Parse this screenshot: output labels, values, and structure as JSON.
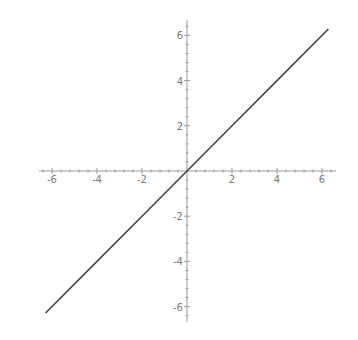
{
  "chart_data": {
    "type": "line",
    "title": "",
    "xlabel": "",
    "ylabel": "",
    "function": "y = x",
    "xlim": [
      -6.5,
      6.5
    ],
    "ylim": [
      -6.5,
      6.5
    ],
    "grid": false,
    "legend": null,
    "axes_origin": [
      0,
      0
    ],
    "x_ticks": [
      -6,
      -4,
      -2,
      2,
      4,
      6
    ],
    "y_ticks": [
      -6,
      -4,
      -2,
      2,
      4,
      6
    ],
    "x_tick_labels": [
      "-6",
      "-4",
      "-2",
      "2",
      "4",
      "6"
    ],
    "y_tick_labels": [
      "-6",
      "-4",
      "-2",
      "2",
      "4",
      "6"
    ],
    "minor_tick_step": 0.4,
    "series": [
      {
        "name": "y = x",
        "color": "#454545",
        "x": [
          -6.283,
          -4,
          -2,
          0,
          2,
          4,
          6.283
        ],
        "y": [
          -6.283,
          -4,
          -2,
          0,
          2,
          4,
          6.283
        ]
      }
    ]
  },
  "style": {
    "axis_color": "#9a9a9a",
    "label_color": "#7a7a7a",
    "line_color": "#454545",
    "background": "#ffffff"
  },
  "layout": {
    "origin_px": [
      187,
      171
    ],
    "px_per_unit_x": 22.5,
    "px_per_unit_y": 22.6,
    "x_axis_extent_px": [
      39,
      336
    ],
    "y_axis_extent_px": [
      20,
      322
    ]
  }
}
